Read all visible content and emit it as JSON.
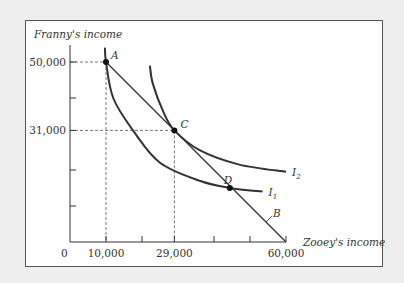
{
  "chart_data": {
    "type": "line",
    "title": "",
    "xlabel": "Zooey's income",
    "ylabel": "Franny's income",
    "xlim": [
      0,
      60000
    ],
    "ylim": [
      0,
      50000
    ],
    "origin_label": "0",
    "x_tick_labels": [
      {
        "value": 10000,
        "label": "10,000"
      },
      {
        "value": 29000,
        "label": "29,000"
      },
      {
        "value": 60000,
        "label": "60,000"
      }
    ],
    "x_minor_ticks": [
      20000,
      40000,
      50000
    ],
    "y_tick_labels": [
      {
        "value": 50000,
        "label": "50,000"
      },
      {
        "value": 31000,
        "label": "31,000"
      }
    ],
    "y_minor_ticks": [
      40000,
      20000,
      10000
    ],
    "series": [
      {
        "name": "B",
        "kind": "budget-line",
        "x": [
          10000,
          60000
        ],
        "y": [
          50000,
          0
        ]
      },
      {
        "name": "I1",
        "kind": "indifference-curve",
        "x": [
          9700,
          10000,
          12000,
          17500,
          25000,
          36000,
          44400,
          53500
        ],
        "y": [
          54000,
          50000,
          40000,
          31000,
          22000,
          17000,
          15000,
          14000
        ]
      },
      {
        "name": "I2",
        "kind": "indifference-curve",
        "x": [
          22200,
          23000,
          26000,
          29000,
          36000,
          47000,
          60000
        ],
        "y": [
          49000,
          44000,
          36000,
          31000,
          25500,
          21500,
          19500
        ]
      }
    ],
    "points": [
      {
        "name": "A",
        "x": 10000,
        "y": 50000
      },
      {
        "name": "C",
        "x": 29000,
        "y": 31000
      },
      {
        "name": "D",
        "x": 44400,
        "y": 15000
      }
    ],
    "guides": [
      {
        "x": 10000,
        "y": 50000
      },
      {
        "x": 29000,
        "y": 31000
      }
    ],
    "curve_labels": {
      "I1": "I",
      "I1_sub": "1",
      "I2": "I",
      "I2_sub": "2",
      "B": "B"
    },
    "grid": false,
    "legend": "none"
  }
}
